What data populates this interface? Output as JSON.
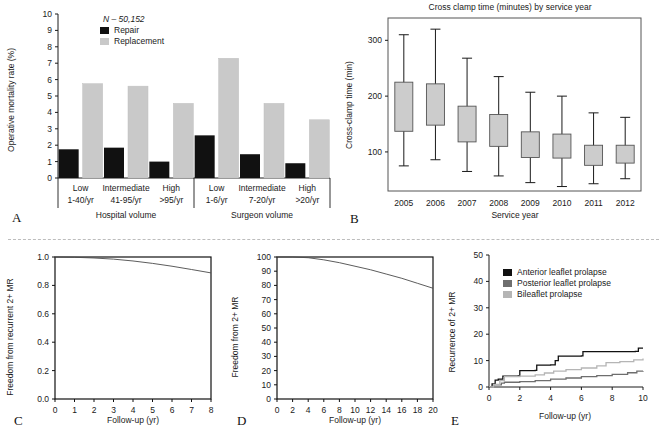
{
  "figure": {
    "panel_letters": {
      "a": "A",
      "b": "B",
      "c": "C",
      "d": "D",
      "e": "E"
    }
  },
  "chart_data": [
    {
      "panel": "A",
      "type": "bar",
      "title": "",
      "xlabel": "",
      "ylabel": "Operative mortality rate (%)",
      "ylim": [
        0,
        10
      ],
      "yticks": [
        0,
        1,
        2,
        3,
        4,
        5,
        6,
        7,
        8,
        9,
        10
      ],
      "annotation": "N – 50,152",
      "grid": false,
      "legend_position": "top-left",
      "group_labels": [
        "Hospital volume",
        "Surgeon volume"
      ],
      "categories": [
        "Low",
        "Intermediate",
        "High",
        "Low",
        "Intermediate",
        "High"
      ],
      "category_sublabels": [
        "1-40/yr",
        "41-95/yr",
        ">95/yr",
        "1-6/yr",
        "7-20/yr",
        ">20/yr"
      ],
      "series": [
        {
          "name": "Repair",
          "color": "#111111",
          "values": [
            1.75,
            1.85,
            1.0,
            2.6,
            1.45,
            0.9
          ]
        },
        {
          "name": "Replacement",
          "color": "#c9c9c9",
          "values": [
            5.75,
            5.6,
            4.55,
            7.3,
            4.55,
            3.55
          ]
        }
      ]
    },
    {
      "panel": "B",
      "type": "boxplot",
      "title": "Cross clamp time (minutes) by service year",
      "xlabel": "Service year",
      "ylabel": "Cross-clamp time (min)",
      "ylim": [
        30,
        340
      ],
      "yticks": [
        100,
        200,
        300
      ],
      "grid": false,
      "box_color": "#cccccc",
      "categories": [
        "2005",
        "2006",
        "2007",
        "2008",
        "2009",
        "2010",
        "2011",
        "2012"
      ],
      "boxes": [
        {
          "year": "2005",
          "whisker_low": 75,
          "q1": 137,
          "q3": 225,
          "whisker_high": 310
        },
        {
          "year": "2006",
          "whisker_low": 86,
          "q1": 148,
          "q3": 222,
          "whisker_high": 320
        },
        {
          "year": "2007",
          "whisker_low": 65,
          "q1": 118,
          "q3": 182,
          "whisker_high": 268
        },
        {
          "year": "2008",
          "whisker_low": 57,
          "q1": 110,
          "q3": 167,
          "whisker_high": 235
        },
        {
          "year": "2009",
          "whisker_low": 45,
          "q1": 90,
          "q3": 136,
          "whisker_high": 207
        },
        {
          "year": "2010",
          "whisker_low": 38,
          "q1": 89,
          "q3": 132,
          "whisker_high": 200
        },
        {
          "year": "2011",
          "whisker_low": 43,
          "q1": 76,
          "q3": 112,
          "whisker_high": 170
        },
        {
          "year": "2012",
          "whisker_low": 52,
          "q1": 80,
          "q3": 112,
          "whisker_high": 162
        }
      ]
    },
    {
      "panel": "C",
      "type": "line",
      "title": "",
      "xlabel": "Follow-up (yr)",
      "ylabel": "Freedom from recurrent 2+ MR",
      "xlim": [
        0,
        8
      ],
      "ylim": [
        0,
        1
      ],
      "xticks": [
        0,
        1,
        2,
        3,
        4,
        5,
        6,
        7,
        8
      ],
      "yticks": [
        "0.0",
        "0.2",
        "0.4",
        "0.6",
        "0.8",
        "1.0"
      ],
      "grid": false,
      "series": [
        {
          "name": "freedom",
          "color": "#4a4a4a",
          "x": [
            0,
            1,
            2,
            3,
            4,
            5,
            6,
            7,
            8
          ],
          "values": [
            1.0,
            0.998,
            0.993,
            0.985,
            0.972,
            0.955,
            0.935,
            0.912,
            0.888
          ]
        }
      ]
    },
    {
      "panel": "D",
      "type": "line",
      "title": "",
      "xlabel": "Follow-up (yr)",
      "ylabel": "Freedom from 2+ MR",
      "xlim": [
        0,
        20
      ],
      "ylim": [
        0,
        100
      ],
      "xticks": [
        0,
        2,
        4,
        6,
        8,
        10,
        12,
        14,
        16,
        18,
        20
      ],
      "yticks": [
        0,
        10,
        20,
        30,
        40,
        50,
        60,
        70,
        80,
        90,
        100
      ],
      "grid": false,
      "series": [
        {
          "name": "freedom",
          "color": "#4a4a4a",
          "x": [
            0,
            2,
            4,
            6,
            8,
            10,
            12,
            14,
            16,
            18,
            20
          ],
          "values": [
            100,
            100,
            99.5,
            98,
            96,
            93.5,
            91,
            88,
            85,
            81.5,
            78
          ]
        }
      ]
    },
    {
      "panel": "E",
      "type": "line",
      "title": "",
      "xlabel": "Follow-up (yr)",
      "ylabel": "Recurrence of 2+ MR",
      "xlim": [
        0,
        10
      ],
      "ylim": [
        0,
        50
      ],
      "xticks": [
        0,
        2,
        4,
        6,
        8,
        10
      ],
      "yticks": [
        0,
        10,
        20,
        30,
        40,
        50
      ],
      "grid": false,
      "legend_position": "top-left",
      "series": [
        {
          "name": "Anterior leaflet prolapse",
          "color": "#111111",
          "x": [
            0,
            0.2,
            0.4,
            0.6,
            0.9,
            1.1,
            1.9,
            2.0,
            3.0,
            3.1,
            4.0,
            4.3,
            4.5,
            6.0,
            6.1,
            9.5,
            9.7,
            10
          ],
          "values": [
            0,
            1.2,
            2.6,
            3.0,
            4.1,
            4.1,
            4.2,
            6.2,
            6.3,
            8.3,
            8.4,
            10.0,
            11.7,
            11.8,
            13.4,
            13.5,
            14.7,
            14.7
          ]
        },
        {
          "name": "Posterior leaflet prolapse",
          "color": "#6e6e6e",
          "x": [
            0,
            0.3,
            0.8,
            1.0,
            2.0,
            3.0,
            4.0,
            5.0,
            6.0,
            7.0,
            8.0,
            9.0,
            9.6,
            10
          ],
          "values": [
            0,
            0.8,
            1.5,
            1.8,
            2.0,
            2.4,
            3.0,
            3.4,
            3.9,
            4.3,
            4.8,
            5.4,
            6.0,
            6.1
          ]
        },
        {
          "name": "Bileaflet prolapse",
          "color": "#b5b5b5",
          "x": [
            0,
            0.3,
            0.7,
            1.0,
            2.0,
            3.0,
            3.6,
            4.2,
            5.0,
            6.0,
            7.0,
            7.6,
            8.5,
            9.4,
            10
          ],
          "values": [
            0,
            1.0,
            2.4,
            3.9,
            4.1,
            4.6,
            5.3,
            6.0,
            6.6,
            7.2,
            8.0,
            9.2,
            9.6,
            10.3,
            10.8
          ]
        }
      ]
    }
  ]
}
